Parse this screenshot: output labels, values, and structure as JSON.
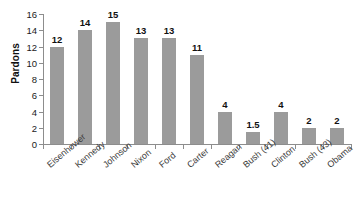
{
  "chart_data": {
    "type": "bar",
    "title": "",
    "subtitle": "",
    "xlabel": "",
    "ylabel": "Pardons",
    "categories": [
      "Eisenhower",
      "Kennedy",
      "Johnson",
      "Nixon",
      "Ford",
      "Carter",
      "Reagan",
      "Bush (41)",
      "Clinton",
      "Bush (43)",
      "Obama"
    ],
    "values": [
      12,
      14,
      15,
      13,
      13,
      11,
      4,
      1.5,
      4,
      2,
      2
    ],
    "value_labels": [
      "12",
      "14",
      "15",
      "13",
      "13",
      "11",
      "4",
      "1.5",
      "4",
      "2",
      "2"
    ],
    "ylim": [
      0,
      16
    ],
    "ytick_values": [
      0,
      2,
      4,
      6,
      8,
      10,
      12,
      14,
      16
    ],
    "ytick_labels": [
      "0",
      "2",
      "4",
      "6",
      "8",
      "10",
      "12",
      "14",
      "16"
    ],
    "grid": false,
    "legend": false,
    "legend_position": "none",
    "bar_color": "#9b9b9b",
    "axis_color": "#8d8d8d",
    "label_color": "#111111",
    "category_label_color": "#3a3a3a",
    "category_label_rotation_deg": -40,
    "background_color": "#ffffff"
  }
}
